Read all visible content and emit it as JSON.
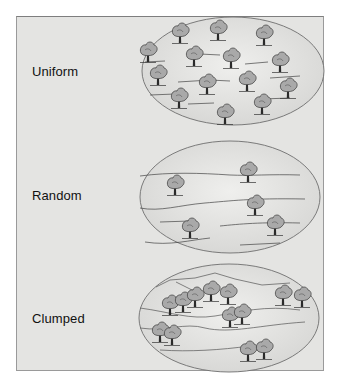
{
  "figure": {
    "panels": [
      {
        "id": "uniform",
        "label": "Uniform",
        "tree_count": 15
      },
      {
        "id": "random",
        "label": "Random",
        "tree_count": 5
      },
      {
        "id": "clumped",
        "label": "Clumped",
        "tree_count": 11
      }
    ]
  },
  "colors": {
    "background": "#e4e4e2",
    "border": "#8a8a8a",
    "ellipse_stroke": "#6e6e6e",
    "tree_fill": "#a8a8a8",
    "tree_stroke": "#333333"
  }
}
